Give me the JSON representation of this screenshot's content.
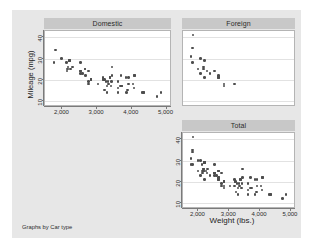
{
  "figure": {
    "y_axis_title": "Mileage (mpg)",
    "x_axis_title": "Weight (lbs.)",
    "footnote": "Graphs by Car type",
    "panel_title_bg": "#c8c8c8",
    "surface_bg": "#e7e7e7",
    "marker_color": "#4d4d4d",
    "gridline_color": "#e2e2e2"
  },
  "panels": {
    "domestic": {
      "title": "Domestic"
    },
    "foreign": {
      "title": "Foreign"
    },
    "total": {
      "title": "Total"
    }
  },
  "axis": {
    "y_ticks": [
      "10",
      "20",
      "30",
      "40"
    ],
    "x_ticks": [
      "2,000",
      "3,000",
      "4,000",
      "5,000"
    ]
  },
  "chart_data": {
    "type": "scatter",
    "title": "",
    "xlabel": "Weight (lbs.)",
    "ylabel": "Mileage (mpg)",
    "footnote": "Graphs by Car type",
    "by_variable": "Car type",
    "xlim": [
      1500,
      5100
    ],
    "ylim": [
      8,
      43
    ],
    "xticks": [
      2000,
      3000,
      4000,
      5000
    ],
    "yticks": [
      10,
      20,
      30,
      40
    ],
    "grid": "horizontal",
    "legend": "none",
    "panel_layout": [
      [
        "Domestic",
        "Foreign"
      ],
      [
        null,
        "Total"
      ]
    ],
    "series": [
      {
        "name": "Domestic",
        "panel": "Domestic",
        "x": [
          4080,
          3670,
          3690,
          3180,
          3220,
          2750,
          3430,
          3210,
          4060,
          3600,
          3600,
          3840,
          3830,
          4330,
          3900,
          4290,
          4330,
          3900,
          4840,
          4720,
          3430,
          3280,
          2200,
          2520,
          2650,
          2750,
          2130,
          2650,
          3250,
          4080,
          3700,
          3720,
          2130,
          2580,
          2200,
          2520,
          3280,
          3880,
          3400,
          2290,
          2520,
          2160,
          3420,
          3020,
          2670,
          2160,
          3170,
          2750,
          2120,
          1800,
          2240,
          2520,
          2830,
          3310,
          2200,
          3370,
          4030,
          3180,
          1760,
          1980,
          2830,
          3600,
          3330,
          2830,
          3370
        ],
        "y": [
          22,
          17,
          22,
          20,
          15,
          18,
          26,
          20,
          16,
          19,
          14,
          14,
          21,
          14,
          18,
          14,
          14,
          21,
          14,
          12,
          22,
          14,
          29,
          28,
          25,
          24,
          25,
          25,
          19,
          22,
          17,
          17,
          24,
          23,
          29,
          24,
          17,
          15,
          17,
          26,
          23,
          26,
          19,
          18,
          22,
          25,
          21,
          19,
          28,
          34,
          25,
          24,
          20,
          19,
          29,
          21,
          18,
          20,
          28,
          30,
          20,
          16,
          18,
          20,
          21
        ],
        "color": "#4d4d4d"
      },
      {
        "name": "Foreign",
        "panel": "Foreign",
        "x": [
          2640,
          2830,
          2070,
          1980,
          1800,
          2160,
          2670,
          2370,
          2280,
          1800,
          2200,
          2520,
          2160,
          2070,
          1830,
          2200,
          2650,
          3170,
          1760,
          2830,
          2650
        ],
        "y": [
          21,
          17,
          23,
          25,
          35,
          25,
          21,
          23,
          24,
          28,
          21,
          24,
          26,
          30,
          41,
          29,
          21,
          18,
          31,
          18,
          22
        ],
        "color": "#4d4d4d"
      },
      {
        "name": "Total",
        "panel": "Total",
        "x": [
          4080,
          3670,
          3690,
          3180,
          3220,
          2750,
          3430,
          3210,
          4060,
          3600,
          3600,
          3840,
          3830,
          4330,
          3900,
          4290,
          4330,
          3900,
          4840,
          4720,
          3430,
          3280,
          2200,
          2520,
          2650,
          2750,
          2130,
          2650,
          3250,
          4080,
          3700,
          3720,
          2130,
          2580,
          2200,
          2520,
          3280,
          3880,
          3400,
          2290,
          2520,
          2160,
          3420,
          3020,
          2670,
          2160,
          3170,
          2750,
          2120,
          1800,
          2240,
          2520,
          2830,
          3310,
          2200,
          3370,
          4030,
          3180,
          1760,
          1980,
          2830,
          3600,
          3330,
          2830,
          3370,
          2640,
          2830,
          2070,
          1980,
          1800,
          2160,
          2670,
          2370,
          2280,
          1800,
          2200,
          2520,
          2160,
          2070,
          1830,
          2200,
          2650,
          3170,
          1760,
          2830,
          2650
        ],
        "y": [
          22,
          17,
          22,
          20,
          15,
          18,
          26,
          20,
          16,
          19,
          14,
          14,
          21,
          14,
          18,
          14,
          14,
          21,
          14,
          12,
          22,
          14,
          29,
          28,
          25,
          24,
          25,
          25,
          19,
          22,
          17,
          17,
          24,
          23,
          29,
          24,
          17,
          15,
          17,
          26,
          23,
          26,
          19,
          18,
          22,
          25,
          21,
          19,
          28,
          34,
          25,
          24,
          20,
          19,
          29,
          21,
          18,
          20,
          28,
          30,
          20,
          16,
          18,
          20,
          21,
          21,
          17,
          23,
          25,
          35,
          25,
          21,
          23,
          24,
          28,
          21,
          24,
          26,
          30,
          41,
          29,
          21,
          18,
          31,
          18,
          22
        ],
        "color": "#4d4d4d"
      }
    ]
  }
}
